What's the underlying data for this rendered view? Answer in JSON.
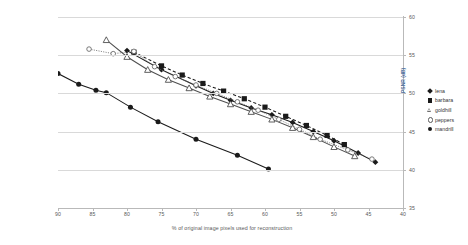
{
  "chart_data": {
    "type": "line",
    "title": "",
    "xlabel": "% of original image pixels used for reconstruction",
    "ylabel": "PSNR (dB)",
    "xlim": [
      90,
      40
    ],
    "ylim": [
      35,
      60
    ],
    "x_ticks": [
      90,
      85,
      80,
      75,
      70,
      65,
      60,
      55,
      50,
      45,
      40
    ],
    "y_ticks": [
      60,
      55,
      50,
      45,
      40,
      35
    ],
    "x_axis_reversed": true,
    "grid": "horizontal",
    "legend_position": "right",
    "series": [
      {
        "name": "lena",
        "marker": "filled-diamond",
        "line": "solid",
        "color": "#1a1a1a",
        "points": [
          [
            80.0,
            55.6
          ],
          [
            75.0,
            53.1
          ],
          [
            70.0,
            51.0
          ],
          [
            67.5,
            50.0
          ],
          [
            65.0,
            49.1
          ],
          [
            62.0,
            48.1
          ],
          [
            59.0,
            47.2
          ],
          [
            56.0,
            46.2
          ],
          [
            53.0,
            45.0
          ],
          [
            50.0,
            43.8
          ],
          [
            46.5,
            42.2
          ],
          [
            44.0,
            41.0
          ]
        ]
      },
      {
        "name": "barbara",
        "marker": "filled-square",
        "line": "dashed",
        "color": "#1a1a1a",
        "points": [
          [
            79.0,
            55.4
          ],
          [
            75.0,
            53.6
          ],
          [
            72.0,
            52.4
          ],
          [
            69.0,
            51.3
          ],
          [
            66.0,
            50.3
          ],
          [
            63.0,
            49.3
          ],
          [
            60.0,
            48.2
          ],
          [
            57.0,
            47.0
          ],
          [
            54.0,
            45.8
          ],
          [
            51.0,
            44.5
          ],
          [
            48.5,
            43.3
          ]
        ]
      },
      {
        "name": "goldhill",
        "marker": "open-triangle",
        "line": "solid",
        "color": "#4f4f4f",
        "points": [
          [
            83.0,
            57.0
          ],
          [
            80.0,
            54.8
          ],
          [
            77.0,
            53.1
          ],
          [
            74.0,
            51.8
          ],
          [
            71.0,
            50.7
          ],
          [
            68.0,
            49.6
          ],
          [
            65.0,
            48.6
          ],
          [
            62.0,
            47.6
          ],
          [
            59.0,
            46.6
          ],
          [
            56.0,
            45.5
          ],
          [
            53.0,
            44.3
          ],
          [
            50.0,
            43.0
          ],
          [
            47.0,
            41.8
          ]
        ]
      },
      {
        "name": "peppers",
        "marker": "open-circle",
        "line": "dotted",
        "color": "#6b6b6b",
        "points": [
          [
            85.5,
            55.8
          ],
          [
            82.0,
            55.2
          ],
          [
            79.0,
            55.5
          ],
          [
            76.0,
            53.5
          ],
          [
            73.0,
            52.2
          ],
          [
            70.0,
            51.1
          ],
          [
            67.0,
            50.0
          ],
          [
            64.0,
            48.9
          ],
          [
            61.0,
            47.8
          ],
          [
            58.0,
            46.6
          ],
          [
            55.0,
            45.3
          ],
          [
            52.0,
            44.0
          ],
          [
            48.0,
            42.6
          ],
          [
            44.5,
            41.4
          ]
        ]
      },
      {
        "name": "mandrill",
        "marker": "filled-circle",
        "line": "solid",
        "color": "#1a1a1a",
        "points": [
          [
            90.0,
            52.6
          ],
          [
            87.0,
            51.2
          ],
          [
            84.5,
            50.4
          ],
          [
            83.0,
            50.1
          ],
          [
            79.5,
            48.2
          ],
          [
            75.5,
            46.3
          ],
          [
            70.0,
            44.0
          ],
          [
            64.0,
            41.9
          ],
          [
            59.5,
            40.1
          ]
        ]
      }
    ]
  },
  "legend": {
    "items": [
      {
        "label": "lena",
        "marker": "filled-diamond"
      },
      {
        "label": "barbara",
        "marker": "filled-square"
      },
      {
        "label": "goldhill",
        "marker": "open-triangle"
      },
      {
        "label": "peppers",
        "marker": "open-circle"
      },
      {
        "label": "mandrill",
        "marker": "filled-circle"
      }
    ]
  }
}
